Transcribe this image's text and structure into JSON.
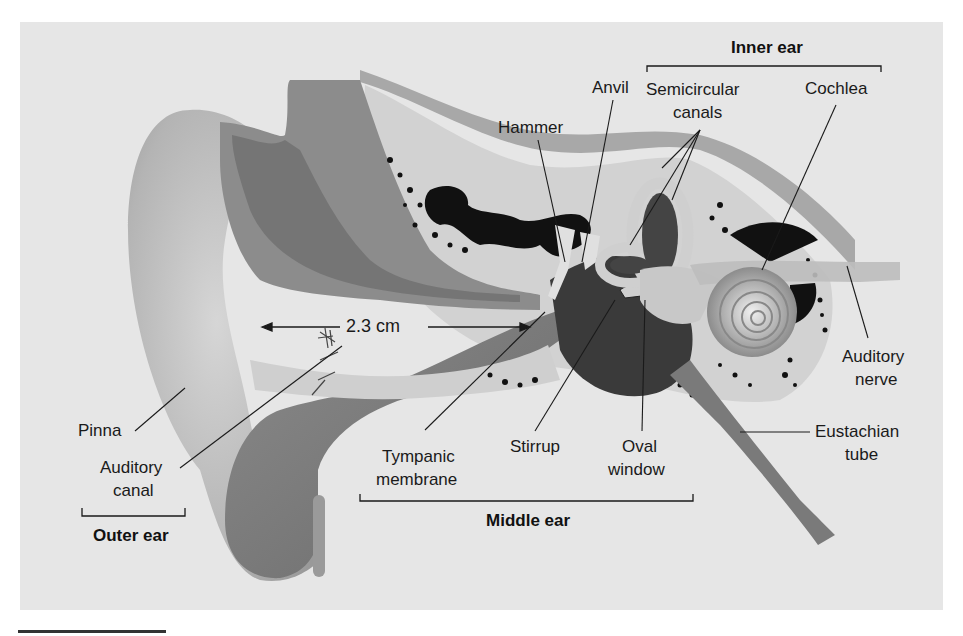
{
  "figure": {
    "measurement": "2.3 cm",
    "sections": [
      {
        "id": "outer",
        "label": "Outer ear"
      },
      {
        "id": "middle",
        "label": "Middle ear"
      },
      {
        "id": "inner",
        "label": "Inner ear"
      }
    ],
    "labels": {
      "pinna": "Pinna",
      "auditory_canal_1": "Auditory",
      "auditory_canal_2": "canal",
      "tympanic_1": "Tympanic",
      "tympanic_2": "membrane",
      "hammer": "Hammer",
      "anvil": "Anvil",
      "stirrup": "Stirrup",
      "oval_1": "Oval",
      "oval_2": "window",
      "semicircular_1": "Semicircular",
      "semicircular_2": "canals",
      "cochlea": "Cochlea",
      "auditory_nerve_1": "Auditory",
      "auditory_nerve_2": "nerve",
      "eustachian_1": "Eustachian",
      "eustachian_2": "tube"
    },
    "colors": {
      "background": "#e6e6e6",
      "tissue_light": "#c8c8c8",
      "tissue_mid": "#9a9a9a",
      "tissue_dark": "#6e6e6e",
      "bone": "#dedede",
      "cavity": "#111111",
      "line": "#1a1a1a"
    }
  }
}
